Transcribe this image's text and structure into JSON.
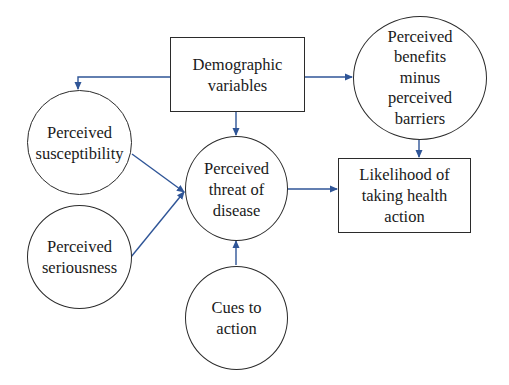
{
  "colors": {
    "arrow": "#2f5597",
    "border": "#2b2b2b",
    "text": "#1a1a1a",
    "background": "#ffffff"
  },
  "nodes": {
    "demographic": {
      "shape": "rectangle",
      "lines": [
        "Demographic",
        "variables"
      ]
    },
    "susceptibility": {
      "shape": "circle",
      "lines": [
        "Perceived",
        "susceptibility"
      ]
    },
    "seriousness": {
      "shape": "circle",
      "lines": [
        "Perceived",
        "seriousness"
      ]
    },
    "threat": {
      "shape": "circle",
      "lines": [
        "Perceived",
        "threat of",
        "disease"
      ]
    },
    "cues": {
      "shape": "circle",
      "lines": [
        "Cues to",
        "action"
      ]
    },
    "benefits": {
      "shape": "circle",
      "lines": [
        "Perceived",
        "benefits",
        "minus",
        "perceived",
        "barriers"
      ]
    },
    "likelihood": {
      "shape": "rectangle",
      "lines": [
        "Likelihood of",
        "taking health",
        "action"
      ]
    }
  },
  "edges": [
    {
      "from": "demographic",
      "to": "susceptibility"
    },
    {
      "from": "demographic",
      "to": "threat"
    },
    {
      "from": "demographic",
      "to": "benefits"
    },
    {
      "from": "susceptibility",
      "to": "threat"
    },
    {
      "from": "seriousness",
      "to": "threat"
    },
    {
      "from": "cues",
      "to": "threat"
    },
    {
      "from": "threat",
      "to": "likelihood"
    },
    {
      "from": "benefits",
      "to": "likelihood"
    }
  ]
}
